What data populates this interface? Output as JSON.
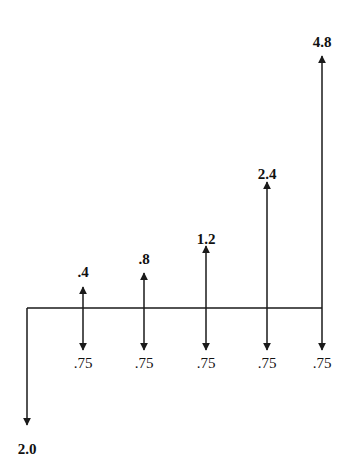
{
  "diagram": {
    "type": "cash-flow-diagram",
    "initial_outflow": {
      "label": "2.0",
      "value": 2.0,
      "x": 27
    },
    "periods": [
      {
        "x": 83,
        "inflow_label": ".4",
        "inflow": 0.4,
        "outflow_label": ".75",
        "outflow": 0.75
      },
      {
        "x": 144,
        "inflow_label": ".8",
        "inflow": 0.8,
        "outflow_label": ".75",
        "outflow": 0.75
      },
      {
        "x": 206,
        "inflow_label": "1.2",
        "inflow": 1.2,
        "outflow_label": ".75",
        "outflow": 0.75
      },
      {
        "x": 267,
        "inflow_label": "2.4",
        "inflow": 2.4,
        "outflow_label": ".75",
        "outflow": 0.75
      },
      {
        "x": 322,
        "inflow_label": "4.8",
        "inflow": 4.8,
        "outflow_label": ".75",
        "outflow": 0.75
      }
    ],
    "colors": {
      "line": "#1a1a1a",
      "background": "#ffffff"
    }
  }
}
